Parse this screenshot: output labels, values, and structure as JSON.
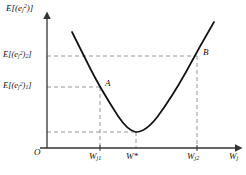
{
  "figure": {
    "type": "line-plot",
    "origin_label": "O",
    "y_axis": {
      "title_html": "E[(e<sub>j</sub><sup>2</sup>)]",
      "ticks": [
        {
          "name": "E2",
          "label_html": "E[(e<sub>j</sub><sup>2</sup>)<sub>2</sub>]",
          "pixel_y": 56
        },
        {
          "name": "E1",
          "label_html": "E[(e<sub>j</sub><sup>2</sup>)<sub>1</sub>]",
          "pixel_y": 87
        }
      ]
    },
    "x_axis": {
      "title_html": "W<sub>j</sub>",
      "ticks": [
        {
          "name": "Wj1",
          "label_html": "W<sub>j1</sub>",
          "pixel_x": 100
        },
        {
          "name": "Wstar",
          "label_html": "W*",
          "pixel_x": 136
        },
        {
          "name": "Wj2",
          "label_html": "W<sub>j2</sub>",
          "pixel_x": 197
        }
      ]
    },
    "points": [
      {
        "name": "A",
        "label": "A",
        "x": 100,
        "y": 87
      },
      {
        "name": "B",
        "label": "B",
        "x": 197,
        "y": 56
      }
    ]
  },
  "chart_data": {
    "type": "line",
    "title": "",
    "xlabel": "W_j",
    "ylabel": "E[(e_j^2)]",
    "xlim": [
      47,
      240
    ],
    "ylim": [
      148,
      14
    ],
    "grid": false,
    "legend": null,
    "curve_points": [
      {
        "x": 72,
        "y": 32
      },
      {
        "x": 80,
        "y": 48
      },
      {
        "x": 90,
        "y": 68
      },
      {
        "x": 100,
        "y": 87
      },
      {
        "x": 110,
        "y": 104
      },
      {
        "x": 118,
        "y": 116
      },
      {
        "x": 126,
        "y": 126
      },
      {
        "x": 136,
        "y": 132
      },
      {
        "x": 146,
        "y": 128
      },
      {
        "x": 156,
        "y": 119
      },
      {
        "x": 166,
        "y": 105
      },
      {
        "x": 176,
        "y": 88
      },
      {
        "x": 186,
        "y": 72
      },
      {
        "x": 197,
        "y": 56
      },
      {
        "x": 207,
        "y": 38
      },
      {
        "x": 214,
        "y": 24
      }
    ],
    "annotations": [
      {
        "text": "A",
        "x": 100,
        "y": 87
      },
      {
        "text": "B",
        "x": 197,
        "y": 56
      }
    ],
    "guide_lines": [
      {
        "name": "hline-E2",
        "orientation": "horizontal",
        "y": 56,
        "from_x": 47,
        "to_x": 197,
        "style": "dashed"
      },
      {
        "name": "hline-E1",
        "orientation": "horizontal",
        "y": 87,
        "from_x": 47,
        "to_x": 100,
        "style": "dashed"
      },
      {
        "name": "hline-min",
        "orientation": "horizontal",
        "y": 132,
        "from_x": 47,
        "to_x": 136,
        "style": "dashed"
      },
      {
        "name": "vline-Wj1",
        "orientation": "vertical",
        "x": 100,
        "from_y": 87,
        "to_y": 148,
        "style": "dashed"
      },
      {
        "name": "vline-Wstar",
        "orientation": "vertical",
        "x": 136,
        "from_y": 132,
        "to_y": 148,
        "style": "dashed"
      },
      {
        "name": "vline-Wj2",
        "orientation": "vertical",
        "x": 197,
        "from_y": 56,
        "to_y": 148,
        "style": "dashed"
      }
    ],
    "colors": {
      "curve": "#111111",
      "axis": "#4a4a4a",
      "dashed": "#7a7a7a",
      "background": "#ffffff"
    }
  }
}
